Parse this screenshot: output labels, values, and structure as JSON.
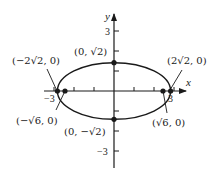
{
  "figure": {
    "type": "ellipse-diagram",
    "equation_implied": "x^2/8 + y^2/2 = 1",
    "axes": {
      "x_label": "x",
      "y_label": "y",
      "x_ticks": [
        -3,
        -2,
        -1,
        1,
        2,
        3
      ],
      "y_ticks": [
        -3,
        -2,
        -1,
        1,
        2,
        3
      ],
      "x_tick_labels": {
        "neg": "−3",
        "pos": "3"
      },
      "y_tick_labels": {
        "pos": "3",
        "neg": "−3"
      }
    },
    "ellipse": {
      "center": [
        0,
        0
      ],
      "semi_major": "2√2",
      "semi_minor": "√2"
    },
    "points": {
      "vertex_left": "(−2√2, 0)",
      "vertex_right": "(2√2, 0)",
      "covertex_top": "(0, √2)",
      "covertex_bottom": "(0, −√2)",
      "focus_left": "(−√6, 0)",
      "focus_right": "(√6, 0)"
    },
    "colors": {
      "stroke": "#1a1a1a",
      "background": "#ffffff"
    }
  }
}
